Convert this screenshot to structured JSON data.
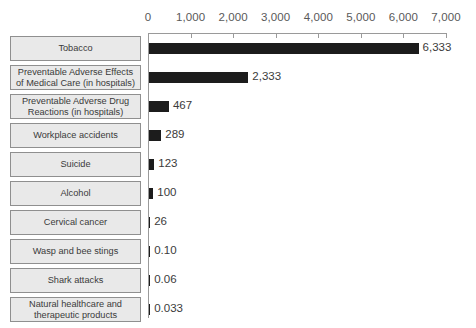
{
  "chart_data": {
    "type": "bar",
    "orientation": "horizontal",
    "title": "",
    "xlabel": "",
    "ylabel": "",
    "xlim": [
      0,
      7000
    ],
    "xticks": [
      0,
      1000,
      2000,
      3000,
      4000,
      5000,
      6000,
      7000
    ],
    "xtick_labels": [
      "0",
      "1,000",
      "2,000",
      "3,000",
      "4,000",
      "5,000",
      "6,000",
      "7,000"
    ],
    "grid": false,
    "legend": false,
    "bar_color": "#1c1c1c",
    "label_box_fill": "#e9e9e9",
    "label_box_border": "#8f8f8f",
    "axis_color": "#9a9a9a",
    "categories": [
      "Tobacco",
      "Preventable Adverse Effects of Medical Care (in hospitals)",
      "Preventable Adverse Drug Reactions (in hospitals)",
      "Workplace accidents",
      "Suicide",
      "Alcohol",
      "Cervical cancer",
      "Wasp and bee stings",
      "Shark attacks",
      "Natural healthcare and therapeutic products"
    ],
    "values": [
      6333,
      2333,
      467,
      289,
      123,
      100,
      26,
      0.1,
      0.06,
      0.033
    ],
    "value_labels": [
      "6,333",
      "2,333",
      "467",
      "289",
      "123",
      "100",
      "26",
      "0.10",
      "0.06",
      "0.033"
    ]
  },
  "rows": [
    {
      "label_line1": "Tobacco",
      "label_line2": "",
      "value_label": "6,333"
    },
    {
      "label_line1": "Preventable Adverse Effects",
      "label_line2": "of Medical Care (in hospitals)",
      "value_label": "2,333"
    },
    {
      "label_line1": "Preventable Adverse Drug",
      "label_line2": "Reactions (in hospitals)",
      "value_label": "467"
    },
    {
      "label_line1": "Workplace accidents",
      "label_line2": "",
      "value_label": "289"
    },
    {
      "label_line1": "Suicide",
      "label_line2": "",
      "value_label": "123"
    },
    {
      "label_line1": "Alcohol",
      "label_line2": "",
      "value_label": "100"
    },
    {
      "label_line1": "Cervical cancer",
      "label_line2": "",
      "value_label": "26"
    },
    {
      "label_line1": "Wasp and bee stings",
      "label_line2": "",
      "value_label": "0.10"
    },
    {
      "label_line1": "Shark attacks",
      "label_line2": "",
      "value_label": "0.06"
    },
    {
      "label_line1": "Natural healthcare and",
      "label_line2": "therapeutic products",
      "value_label": "0.033"
    }
  ]
}
